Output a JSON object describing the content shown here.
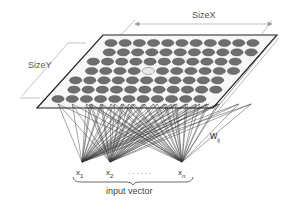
{
  "diagram": {
    "labels": {
      "size_x": "SizeX",
      "size_y": "SizeY",
      "weight": "w",
      "weight_sub": "ij",
      "input_1": "x",
      "input_1_sub": "1",
      "input_2": "x",
      "input_2_sub": "2",
      "input_dots": "......",
      "input_n": "x",
      "input_n_sub": "n",
      "input_vector": "input vector"
    },
    "grid": {
      "columns": 11,
      "rows": 7,
      "layout": "hexagonal",
      "node_color": "#6e6e6e",
      "winner_node_color": "#e8e8e8"
    },
    "inputs": [
      {
        "name": "x1",
        "x": 82,
        "y": 162
      },
      {
        "name": "x2",
        "x": 110,
        "y": 162
      },
      {
        "name": "xn",
        "x": 182,
        "y": 162
      }
    ],
    "colors": {
      "plane_border": "#222222",
      "connection": "#111111",
      "dimension_line": "#888888"
    }
  }
}
